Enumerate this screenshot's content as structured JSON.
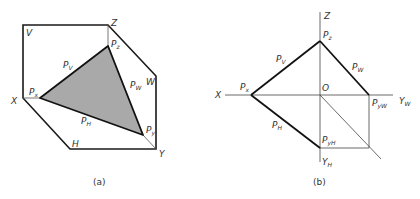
{
  "figure_a": {
    "caption": "(a)",
    "labels": {
      "V": "V",
      "Z": "Z",
      "W": "W",
      "X": "X",
      "Y": "Y",
      "H": "H",
      "Pz": {
        "main": "P",
        "sub": "z"
      },
      "Pv": {
        "main": "P",
        "sub": "V"
      },
      "Pw": {
        "main": "P",
        "sub": "W"
      },
      "Px": {
        "main": "P",
        "sub": "x"
      },
      "Ph": {
        "main": "P",
        "sub": "H"
      },
      "Py": {
        "main": "P",
        "sub": "y"
      }
    },
    "fill_color": "#a9a9a9",
    "line_color": "#1a1a1a"
  },
  "figure_b": {
    "caption": "(b)",
    "labels": {
      "Z": "Z",
      "X": "X",
      "O": "O",
      "Yw": {
        "main": "Y",
        "sub": "W"
      },
      "Yh": {
        "main": "Y",
        "sub": "H"
      },
      "Pz": {
        "main": "P",
        "sub": "z"
      },
      "Pv": {
        "main": "P",
        "sub": "V"
      },
      "Pw": {
        "main": "P",
        "sub": "W"
      },
      "Px": {
        "main": "P",
        "sub": "x"
      },
      "Ph": {
        "main": "P",
        "sub": "H"
      },
      "Pyw": {
        "main": "P",
        "sub": "yW"
      },
      "Pyh": {
        "main": "P",
        "sub": "yH"
      }
    }
  }
}
